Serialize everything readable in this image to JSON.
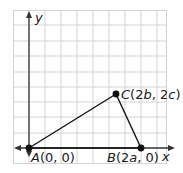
{
  "diagram": {
    "axes": {
      "x_label": "x",
      "y_label": "y"
    },
    "points": [
      {
        "name": "A",
        "label": "A(0, 0)",
        "px": [
          29,
          148
        ]
      },
      {
        "name": "B",
        "label": "B(2a, 0)",
        "px": [
          141,
          148
        ]
      },
      {
        "name": "C",
        "label": "C(2b, 2c)",
        "px": [
          116,
          94
        ]
      }
    ],
    "triangle": [
      "A",
      "B",
      "C"
    ],
    "colors": {
      "grid": "#cfcfcf",
      "axis": "#333333",
      "line": "#111111",
      "point": "#111111"
    }
  }
}
